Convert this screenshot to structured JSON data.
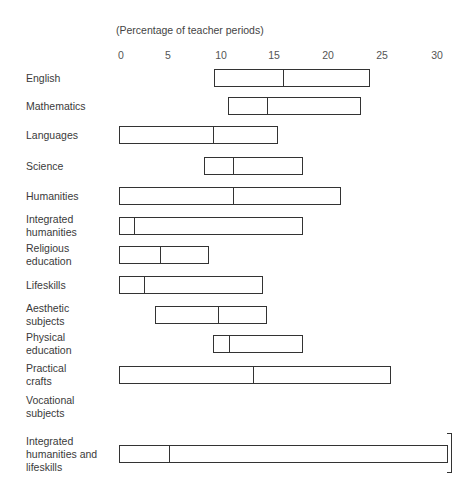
{
  "chart_data": {
    "type": "bar",
    "subtype": "range-box",
    "title": "",
    "subtitle": "(Percentage of teacher periods)",
    "xlabel": "(Percentage of teacher periods)",
    "ylabel": "",
    "xlim": [
      0,
      30
    ],
    "x_ticks": [
      "0",
      "5",
      "10",
      "15",
      "20",
      "25",
      "30"
    ],
    "grid": false,
    "legend": null,
    "categories": [
      "English",
      "Mathematics",
      "Languages",
      "Science",
      "Humanities",
      "Integrated humanities",
      "Religious education",
      "Lifeskills",
      "Aesthetic subjects",
      "Physical education",
      "Practical crafts",
      "Vocational subjects",
      "Integrated humanities and lifeskills"
    ],
    "series": [
      {
        "name": "min",
        "values": [
          9,
          10.3,
          0,
          8,
          0,
          0,
          0,
          0,
          3.4,
          8.9,
          0,
          null,
          0
        ]
      },
      {
        "name": "median",
        "values": [
          15.5,
          14,
          8.9,
          10.8,
          10.8,
          1.4,
          3.9,
          2.4,
          9.3,
          10.4,
          12.6,
          null,
          4.7
        ]
      },
      {
        "name": "max",
        "values": [
          23.7,
          22.8,
          15,
          17.4,
          20.9,
          17.4,
          8.5,
          13.6,
          14,
          17.4,
          25.7,
          null,
          31
        ]
      }
    ],
    "annotations": [
      "bracket at right end of 'Integrated humanities and lifeskills' bar"
    ]
  },
  "axis": {
    "subtitle": "(Percentage of teacher periods)",
    "ticks": [
      {
        "label": "0",
        "x": 121
      },
      {
        "label": "5",
        "x": 168
      },
      {
        "label": "10",
        "x": 221
      },
      {
        "label": "15",
        "x": 274
      },
      {
        "label": "20",
        "x": 328
      },
      {
        "label": "25",
        "x": 382
      },
      {
        "label": "30",
        "x": 437
      }
    ]
  },
  "rows": [
    {
      "label": "English",
      "y": 78,
      "min": 9,
      "mid": 15.5,
      "max": 23.7
    },
    {
      "label": "Mathematics",
      "y": 106,
      "min": 10.3,
      "mid": 14,
      "max": 22.8
    },
    {
      "label": "Languages",
      "y": 135,
      "min": 0,
      "mid": 8.9,
      "max": 15
    },
    {
      "label": "Science",
      "y": 166,
      "min": 8,
      "mid": 10.8,
      "max": 17.4
    },
    {
      "label": "Humanities",
      "y": 196,
      "min": 0,
      "mid": 10.8,
      "max": 20.9
    },
    {
      "label": "Integrated\nhumanities",
      "y": 226,
      "min": 0,
      "mid": 1.4,
      "max": 17.4
    },
    {
      "label": "Religious\neducation",
      "y": 255,
      "min": 0,
      "mid": 3.9,
      "max": 8.5
    },
    {
      "label": "Lifeskills",
      "y": 285,
      "min": 0,
      "mid": 2.4,
      "max": 13.6
    },
    {
      "label": "Aesthetic\nsubjects",
      "y": 315,
      "min": 3.4,
      "mid": 9.3,
      "max": 14
    },
    {
      "label": "Physical\neducation",
      "y": 344,
      "min": 8.9,
      "mid": 10.4,
      "max": 17.4
    },
    {
      "label": "Practical\ncrafts",
      "y": 375,
      "min": 0,
      "mid": 12.6,
      "max": 25.7
    },
    {
      "label": "Vocational\nsubjects",
      "y": 407,
      "min": null,
      "mid": null,
      "max": null
    },
    {
      "label": "Integrated\nhumanities and\nlifeskills",
      "y": 454,
      "min": 0,
      "mid": 4.7,
      "max": 31
    }
  ]
}
